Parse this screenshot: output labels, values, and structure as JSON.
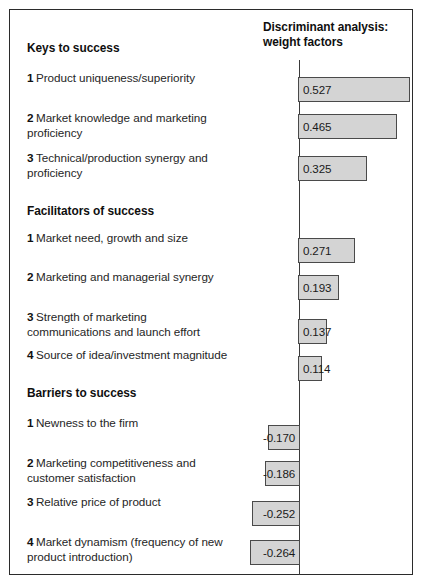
{
  "chart_title_line1": "Discriminant analysis:",
  "chart_title_line2": "weight factors",
  "groups": [
    {
      "heading": "Keys to success",
      "items": [
        {
          "num": "1",
          "label": "Product uniqueness/superiority"
        },
        {
          "num": "2",
          "label": "Market knowledge and marketing proficiency"
        },
        {
          "num": "3",
          "label": "Technical/production synergy and proficiency"
        }
      ]
    },
    {
      "heading": "Facilitators of success",
      "items": [
        {
          "num": "1",
          "label": "Market need, growth and size"
        },
        {
          "num": "2",
          "label": "Marketing and managerial synergy"
        },
        {
          "num": "3",
          "label": "Strength of marketing communications and launch effort"
        },
        {
          "num": "4",
          "label": "Source of idea/investment magnitude"
        }
      ]
    },
    {
      "heading": "Barriers to success",
      "items": [
        {
          "num": "1",
          "label": "Newness to the firm"
        },
        {
          "num": "2",
          "label": "Marketing competitiveness and customer satisfaction"
        },
        {
          "num": "3",
          "label": "Relative price of product"
        },
        {
          "num": "4",
          "label": "Market dynamism (frequency of new product introduction)"
        }
      ]
    }
  ],
  "bars": [
    {
      "value": 0.527,
      "label": "0.527"
    },
    {
      "value": 0.465,
      "label": "0.465"
    },
    {
      "value": 0.325,
      "label": "0.325"
    },
    {
      "value": 0.271,
      "label": "0.271"
    },
    {
      "value": 0.193,
      "label": "0.193"
    },
    {
      "value": 0.137,
      "label": "0.137"
    },
    {
      "value": 0.114,
      "label": "0.114"
    },
    {
      "value": -0.17,
      "label": "-0.170"
    },
    {
      "value": -0.186,
      "label": "-0.186"
    },
    {
      "value": -0.252,
      "label": "-0.252"
    },
    {
      "value": -0.264,
      "label": "-0.264"
    }
  ],
  "colors": {
    "bar_fill": "#d4d4d4",
    "bar_stroke": "#4a4a4a",
    "axis": "#3a3a3a",
    "border": "#2b2b2b",
    "text": "#262626"
  },
  "chart_data": {
    "type": "bar",
    "orientation": "horizontal",
    "title": "Discriminant analysis: weight factors",
    "xlabel": "",
    "ylabel": "",
    "xlim": [
      -0.3,
      0.6
    ],
    "grid": false,
    "legend": "none",
    "categories": [
      "Keys to success 1 Product uniqueness/superiority",
      "Keys to success 2 Market knowledge and marketing proficiency",
      "Keys to success 3 Technical/production synergy and proficiency",
      "Facilitators of success 1 Market need, growth and size",
      "Facilitators of success 2 Marketing and managerial synergy",
      "Facilitators of success 3 Strength of marketing communications and launch effort",
      "Facilitators of success 4 Source of idea/investment magnitude",
      "Barriers to success 1 Newness to the firm",
      "Barriers to success 2 Marketing competitiveness and customer satisfaction",
      "Barriers to success 3 Relative price of product",
      "Barriers to success 4 Market dynamism (frequency of new product introduction)"
    ],
    "values": [
      0.527,
      0.465,
      0.325,
      0.271,
      0.193,
      0.137,
      0.114,
      -0.17,
      -0.186,
      -0.252,
      -0.264
    ],
    "data_labels": [
      "0.527",
      "0.465",
      "0.325",
      "0.271",
      "0.193",
      "0.137",
      "0.114",
      "-0.170",
      "-0.186",
      "-0.252",
      "-0.264"
    ]
  }
}
